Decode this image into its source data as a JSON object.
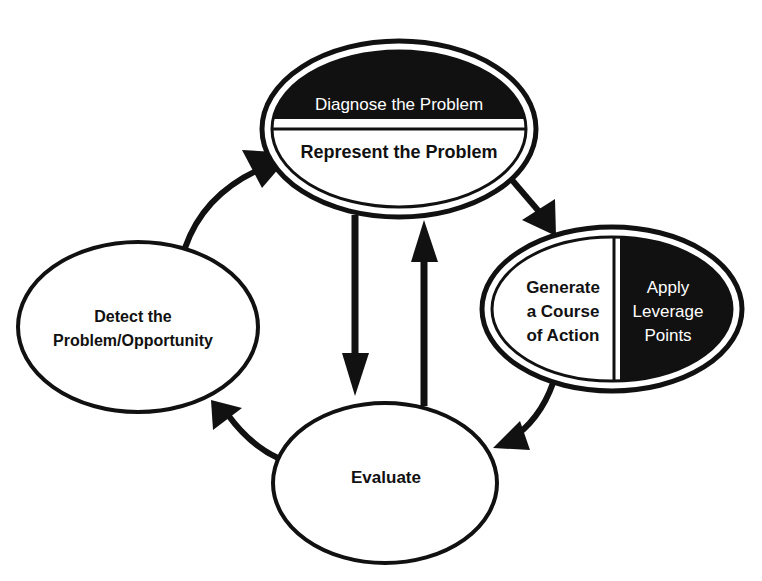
{
  "diagram": {
    "type": "cycle",
    "colors": {
      "ink": "#111111",
      "paper": "#ffffff"
    },
    "nodes": [
      {
        "id": "diagnose",
        "label": "Diagnose the Problem",
        "style": "filled-dark",
        "group": "top"
      },
      {
        "id": "represent",
        "label": "Represent the Problem",
        "style": "outline",
        "group": "top"
      },
      {
        "id": "generate",
        "lines": [
          "Generate",
          "a Course",
          "of Action"
        ],
        "style": "outline",
        "group": "right"
      },
      {
        "id": "leverage",
        "lines": [
          "Apply",
          "Leverage",
          "Points"
        ],
        "style": "filled-dark",
        "group": "right"
      },
      {
        "id": "detect",
        "lines": [
          "Detect the",
          "Problem/Opportunity"
        ],
        "style": "outline",
        "group": "left"
      },
      {
        "id": "evaluate",
        "label": "Evaluate",
        "style": "outline",
        "group": "bottom"
      }
    ],
    "edges": [
      {
        "from": "detect",
        "to": "top",
        "shape": "curved"
      },
      {
        "from": "top",
        "to": "right",
        "shape": "straight"
      },
      {
        "from": "right",
        "to": "evaluate",
        "shape": "curved"
      },
      {
        "from": "evaluate",
        "to": "detect",
        "shape": "curved"
      },
      {
        "from": "top",
        "to": "evaluate",
        "shape": "straight-down"
      },
      {
        "from": "evaluate",
        "to": "top",
        "shape": "straight-up"
      }
    ]
  },
  "labels": {
    "diagnose": "Diagnose the Problem",
    "represent": "Represent the Problem",
    "generate": [
      "Generate",
      "a Course",
      "of Action"
    ],
    "leverage": [
      "Apply",
      "Leverage",
      "Points"
    ],
    "detect": [
      "Detect the",
      "Problem/Opportunity"
    ],
    "evaluate": "Evaluate"
  }
}
